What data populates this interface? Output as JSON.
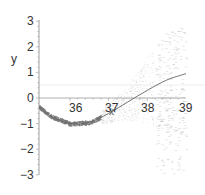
{
  "chart_data": {
    "type": "scatter",
    "title": "",
    "xlabel": "x",
    "ylabel": "y",
    "xlim": [
      35.2,
      39
    ],
    "ylim": [
      -3,
      3
    ],
    "x_ticks": [
      "36",
      "37",
      "38",
      "39"
    ],
    "y_ticks": [
      "3",
      "2",
      "1",
      "0",
      "−1",
      "−2",
      "−3"
    ],
    "grid": false,
    "legend": "none",
    "series": [
      {
        "name": "fitted curve",
        "kind": "line",
        "x": [
          35.2,
          35.5,
          36.0,
          36.5,
          37.0,
          37.5,
          38.0,
          38.5,
          39.0
        ],
        "y": [
          -0.35,
          -0.7,
          -1.0,
          -0.95,
          -0.6,
          -0.15,
          0.3,
          0.7,
          0.95
        ]
      },
      {
        "name": "samples",
        "kind": "scatter",
        "description": "dense points hugging curve for x<37, spreading widely (about -3 to 2.5) as x approaches 39"
      }
    ],
    "reference_lines": [
      {
        "orientation": "horizontal",
        "y": 0
      },
      {
        "orientation": "horizontal",
        "y": 0.5,
        "style": "faint"
      }
    ]
  }
}
